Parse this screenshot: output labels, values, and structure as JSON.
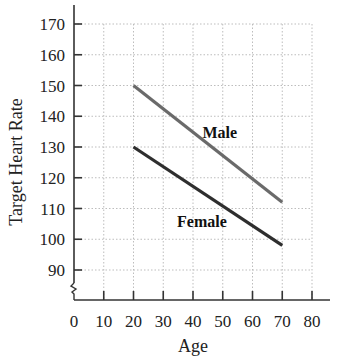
{
  "chart_data": {
    "type": "line",
    "title": "",
    "xlabel": "Age",
    "ylabel": "Target Heart Rate",
    "xlim": [
      0,
      80
    ],
    "ylim": [
      85,
      170
    ],
    "y_axis_break": true,
    "grid": true,
    "x_ticks": [
      0,
      10,
      20,
      30,
      40,
      50,
      60,
      70,
      80
    ],
    "y_ticks": [
      90,
      100,
      110,
      120,
      130,
      140,
      150,
      160,
      170
    ],
    "series": [
      {
        "name": "Male",
        "x": [
          20,
          70
        ],
        "y": [
          150,
          112
        ],
        "color": "#6a6a6a",
        "label_pos": [
          49,
          133
        ]
      },
      {
        "name": "Female",
        "x": [
          20,
          70
        ],
        "y": [
          130,
          98
        ],
        "color": "#2e2e2e",
        "label_pos": [
          43,
          104
        ]
      }
    ],
    "legend": "inline labels"
  },
  "colors": {
    "grid": "#bdbdbd",
    "axis": "#333333",
    "text": "#222222"
  }
}
